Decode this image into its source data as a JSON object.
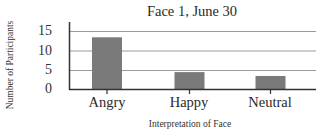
{
  "chart_data": {
    "type": "bar",
    "title": "Face 1, June 30",
    "xlabel": "Interpretation of Face",
    "ylabel": "Number of Participants",
    "categories": [
      "Angry",
      "Happy",
      "Neutral"
    ],
    "values": [
      13.5,
      4.5,
      3.5
    ],
    "ylim": [
      0,
      15
    ],
    "yticks": [
      0,
      5,
      10,
      15
    ],
    "grid": true,
    "legend": null,
    "colors": {
      "bar": "#7a7a7a",
      "grid": "#9a9a9a",
      "axis": "#333333"
    }
  }
}
